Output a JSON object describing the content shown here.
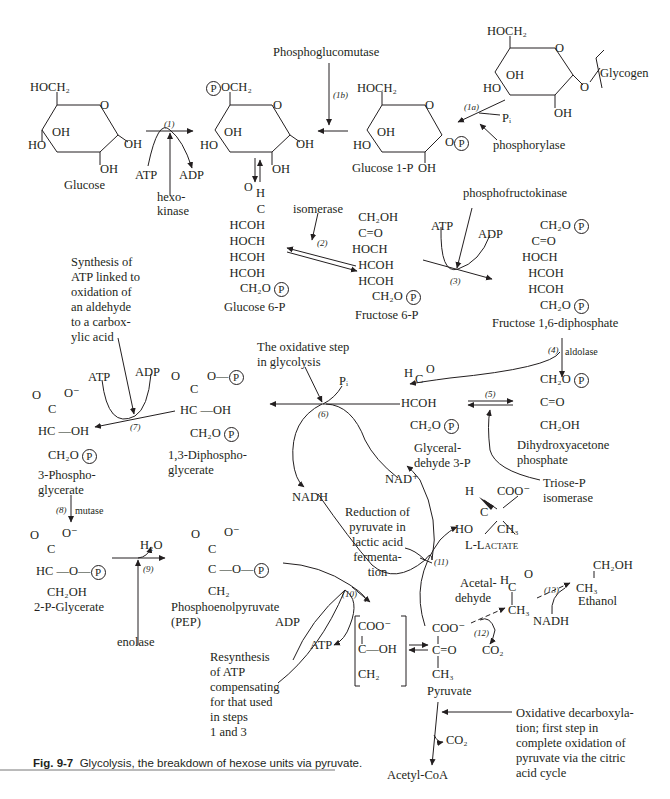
{
  "figure": {
    "caption_label": "Fig. 9-7",
    "caption_text": "Glycolysis, the breakdown of hexose units via pyruvate.",
    "phospho_symbol": "P"
  },
  "compounds": {
    "glucose": {
      "name": "Glucose",
      "ch2": "HOCH₂",
      "ring_o": "O",
      "oh1": "OH",
      "oh2": "OH",
      "oh3": "OH",
      "ho": "HO"
    },
    "glucose6p_ring": {
      "ch2": "OCH₂",
      "ring_o": "O",
      "oh1": "OH",
      "oh2": "OH",
      "oh3": "OH",
      "ho": "HO"
    },
    "glucose1p": {
      "name": "Glucose 1-P",
      "ch2": "HOCH₂",
      "ring_o": "O",
      "o_p": "O",
      "oh1": "OH",
      "oh2": "OH",
      "ho": "HO"
    },
    "glycogen": {
      "name": "Glycogen",
      "ch2": "HOCH₂",
      "ring_o": "O",
      "o_link": "O",
      "oh1": "OH",
      "oh2": "OH",
      "ho": "HO"
    },
    "glucose6p": {
      "name": "Glucose 6-P",
      "lines": [
        "H",
        "C=O",
        "HCOH",
        "HOCH",
        "HCOH",
        "HCOH",
        "CH₂O"
      ]
    },
    "fructose6p": {
      "name": "Fructose 6-P",
      "lines": [
        "CH₂OH",
        "C=O",
        "HOCH",
        "HCOH",
        "HCOH",
        "CH₂O"
      ]
    },
    "fructose16dp": {
      "name": "Fructose 1,6-diphosphate",
      "lines": [
        "CH₂O",
        "C=O",
        "HOCH",
        "HCOH",
        "HCOH",
        "CH₂O"
      ]
    },
    "gap": {
      "name_l1": "Glyceral-",
      "name_l2": "dehyde 3-P",
      "lines": [
        "H",
        "C=O",
        "HCOH",
        "CH₂O"
      ]
    },
    "dhap": {
      "name_l1": "Dihydroxyacetone",
      "name_l2": "phosphate",
      "lines": [
        "CH₂O",
        "C=O",
        "CH₂OH"
      ]
    },
    "bpg13": {
      "name_l1": "1,3-Diphospho-",
      "name_l2": "glycerate",
      "lines": [
        "O",
        "C",
        "O—",
        "HC—OH",
        "CH₂O"
      ]
    },
    "pg3": {
      "name_l1": "3-Phospho-",
      "name_l2": "glycerate",
      "lines": [
        "O",
        "C",
        "O⁻",
        "HC—OH",
        "CH₂O"
      ]
    },
    "pg2": {
      "name": "2-P-Glycerate",
      "lines": [
        "O",
        "C",
        "O⁻",
        "HC—O—",
        "CH₂OH"
      ]
    },
    "pep": {
      "name_l1": "Phosphoenolpyruvate",
      "name_l2": "(PEP)",
      "lines": [
        "O",
        "C",
        "O⁻",
        "C—O—",
        "CH₂"
      ]
    },
    "enol": {
      "lines": [
        "COO⁻",
        "C—OH",
        "CH₂"
      ]
    },
    "pyruvate": {
      "name": "Pyruvate",
      "lines": [
        "COO⁻",
        "C=O",
        "CH₃"
      ]
    },
    "lactate": {
      "name": "L-Lactate",
      "lines": [
        "H",
        "COO⁻",
        "C",
        "HO",
        "CH₃"
      ]
    },
    "acetaldehyde": {
      "name_l1": "Acetal-",
      "name_l2": "dehyde",
      "lines": [
        "H",
        "C=O",
        "CH₃"
      ]
    },
    "ethanol": {
      "name": "Ethanol",
      "lines": [
        "CH₂OH",
        "CH₃"
      ]
    },
    "acetylcoa": {
      "name": "Acetyl-CoA"
    }
  },
  "cofactors": {
    "atp": "ATP",
    "adp": "ADP",
    "pi": "Pᵢ",
    "nadh": "NADH",
    "nad": "NAD⁺",
    "h2o": "H₂O",
    "co2": "CO₂"
  },
  "enzymes": {
    "hexokinase_l1": "hexo-",
    "hexokinase_l2": "kinase",
    "phosphoglucomutase": "Phosphoglucomutase",
    "phosphorylase": "phosphorylase",
    "isomerase": "isomerase",
    "phosphofructokinase": "phosphofructokinase",
    "aldolase": "aldolase",
    "triose_l1": "Triose-P",
    "triose_l2": "isomerase",
    "mutase": "mutase",
    "enolase": "enolase"
  },
  "steps": {
    "s1": "(1)",
    "s1a": "(1a)",
    "s1b": "(1b)",
    "s2": "(2)",
    "s3": "(3)",
    "s4": "(4)",
    "s5": "(5)",
    "s6": "(6)",
    "s7": "(7)",
    "s8": "(8)",
    "s9": "(9)",
    "s10": "(10)",
    "s11": "(11)",
    "s12": "(12)",
    "s13": "(13)"
  },
  "annotations": {
    "atp_synthesis": "Synthesis of\nATP linked to\noxidation of\nan aldehyde\nto a carbox-\nylic acid",
    "oxidative_step": "The oxidative step\nin glycolysis",
    "lactic_reduction": "Reduction of\npyruvate in\nlactic acid\nfermenta-\ntion",
    "resynthesis": "Resynthesis\nof ATP\ncompensating\nfor that used\nin steps\n1 and 3",
    "oxidative_decarbox": "Oxidative decarboxyla-\ntion; first step in\ncomplete oxidation of\npyruvate via the citric\nacid cycle"
  }
}
